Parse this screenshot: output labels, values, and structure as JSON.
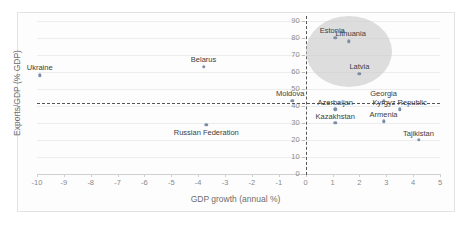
{
  "chart_data": {
    "type": "scatter",
    "title": "",
    "xlabel": "GDP growth (annual %)",
    "ylabel": "Exports/GDP (% GDP)",
    "xlim": [
      -10,
      5
    ],
    "ylim": [
      0,
      90
    ],
    "xticks": [
      "-10",
      "-9",
      "-8",
      "-7",
      "-6",
      "-5",
      "-4",
      "-3",
      "-2",
      "-1",
      "0",
      "1",
      "2",
      "3",
      "4",
      "5"
    ],
    "yticks": [
      "0",
      "10",
      "20",
      "30",
      "40",
      "50",
      "60",
      "70",
      "80",
      "90"
    ],
    "grid": "horizontal",
    "legend": "none",
    "reference_lines": [
      {
        "name": "zero-growth-line",
        "orientation": "vertical",
        "value": 0,
        "style": "dashed"
      },
      {
        "name": "exports-average-line",
        "orientation": "horizontal",
        "value": 42,
        "style": "dashed"
      }
    ],
    "highlight_region": {
      "name": "baltic-cluster-ellipse",
      "shape": "ellipse",
      "x_center": 1.6,
      "y_center": 72,
      "x_radius": 1.6,
      "y_radius": 21,
      "color": "#c9c9c9"
    },
    "points": [
      {
        "label": "Ukraine",
        "x": -9.9,
        "y": 58,
        "label_dx": 0,
        "label_dy": -11
      },
      {
        "label": "Belarus",
        "x": -3.8,
        "y": 63,
        "label_dx": 0,
        "label_dy": -11
      },
      {
        "label": "Russian Federation",
        "x": -3.7,
        "y": 29,
        "label_dx": 0,
        "label_dy": 4
      },
      {
        "label": "Moldova",
        "x": -0.5,
        "y": 43,
        "label_dx": -2,
        "label_dy": -11
      },
      {
        "label": "Estonia",
        "x": 1.1,
        "y": 80,
        "label_dx": -3,
        "label_dy": -11
      },
      {
        "label": "Lithuania",
        "x": 1.6,
        "y": 78,
        "label_dx": 2,
        "label_dy": -11
      },
      {
        "label": "Latvia",
        "x": 2.0,
        "y": 59,
        "label_dx": 0,
        "label_dy": -11
      },
      {
        "label": "Georgia",
        "x": 2.9,
        "y": 43,
        "label_dx": 0,
        "label_dy": -11
      },
      {
        "label": "Azerbaijan",
        "x": 1.1,
        "y": 38,
        "label_dx": 0,
        "label_dy": -10
      },
      {
        "label": "Kyrgyz Republic",
        "x": 3.5,
        "y": 38,
        "label_dx": 0,
        "label_dy": -10
      },
      {
        "label": "Kazakhstan",
        "x": 1.1,
        "y": 30,
        "label_dx": 0,
        "label_dy": -10
      },
      {
        "label": "Armenia",
        "x": 2.9,
        "y": 31,
        "label_dx": 0,
        "label_dy": -10
      },
      {
        "label": "Tajikistan",
        "x": 4.2,
        "y": 20,
        "label_dx": 0,
        "label_dy": -10
      }
    ]
  }
}
